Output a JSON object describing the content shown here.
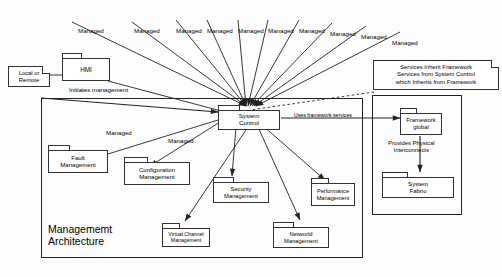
{
  "diagram": {
    "title_management": "Managememt\nArchitecture",
    "title_computational": "Computational\nArchitecture"
  },
  "nodes": {
    "hmi": "HMI",
    "system_control": "System\nControl",
    "fault_management": "Fault\nManagement",
    "configuration_management": "Configuration\nManagement",
    "security_management": "Security\nManagement",
    "performance_management": "Performance\nManagement",
    "virtual_channel_management": "Virtual Channel\nManagement",
    "network_management": "Networld\nManagement",
    "framework_global": "Framework\nglobal",
    "system_fabric": "System\nFabrio"
  },
  "notes": {
    "local_or_remote": "Local or\nRemote",
    "inheritance": "Services Inherit Framework\nServices from System Control\nwhich Inherits from Framework"
  },
  "edge_labels": {
    "initiates_management": "Initiates management",
    "uses_framework_services": "Uses framework services",
    "provides_physical_interconnects": "Provides Physical\nInterconnects",
    "managed_left_1": "Managed",
    "managed_left_2": "Managed"
  },
  "managed_fan": [
    {
      "text": "Managed",
      "x": 78,
      "y": 27
    },
    {
      "text": "Managed",
      "x": 134,
      "y": 27
    },
    {
      "text": "Managed",
      "x": 176,
      "y": 27
    },
    {
      "text": "Managed",
      "x": 207,
      "y": 27
    },
    {
      "text": "Managed",
      "x": 238,
      "y": 27
    },
    {
      "text": "Managed",
      "x": 268,
      "y": 27
    },
    {
      "text": "Managed",
      "x": 299,
      "y": 27
    },
    {
      "text": "Managed",
      "x": 330,
      "y": 30
    },
    {
      "text": "Managed",
      "x": 361,
      "y": 33
    },
    {
      "text": "Managed",
      "x": 392,
      "y": 39
    }
  ],
  "colors": {
    "stroke": "#222222",
    "background": "#ffffff",
    "text": "#000000"
  }
}
